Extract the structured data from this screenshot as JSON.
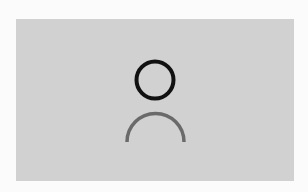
{
  "placeholder": {
    "icon": "user-avatar-placeholder-icon",
    "colors": {
      "page_background": "#fbfbfb",
      "frame_background": "#d1d1d1",
      "head_stroke": "#111111",
      "body_stroke": "#6a6a6a"
    }
  }
}
